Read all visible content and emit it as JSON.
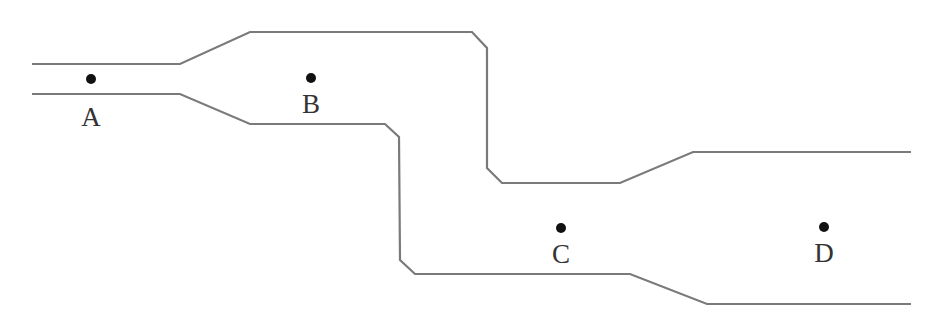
{
  "diagram": {
    "colors": {
      "wall": "#7a7a7a",
      "point": "#111111",
      "label": "#333333",
      "background": "#ffffff"
    },
    "walls": {
      "upper": "32,64 180,64 250,32 472,32 487,48 487,168 502,183 620,183 693,152 911,152",
      "lower": "32,94 180,94 250,124 385,124 399,137 400,260 415,274 630,274 707,304 911,304"
    },
    "points": [
      {
        "label": "A",
        "dot_x": 91,
        "dot_y": 79,
        "label_x": 91,
        "label_y": 126
      },
      {
        "label": "B",
        "dot_x": 311,
        "dot_y": 78,
        "label_x": 311,
        "label_y": 113
      },
      {
        "label": "C",
        "dot_x": 561,
        "dot_y": 228,
        "label_x": 561,
        "label_y": 263
      },
      {
        "label": "D",
        "dot_x": 824,
        "dot_y": 227,
        "label_x": 824,
        "label_y": 262
      }
    ]
  }
}
